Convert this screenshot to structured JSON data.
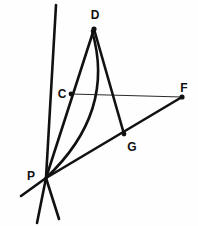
{
  "figure": {
    "background_color": "#fefefe",
    "ink_color": "#111111",
    "width": 198,
    "height": 226
  },
  "points": [
    {
      "id": "D",
      "label": "D",
      "x": 94,
      "y": 29,
      "label_x": 95,
      "label_y": 19,
      "dot": true
    },
    {
      "id": "C",
      "label": "C",
      "x": 71,
      "y": 94,
      "label_x": 62,
      "label_y": 94,
      "dot": true
    },
    {
      "id": "F",
      "label": "F",
      "x": 182,
      "y": 97,
      "label_x": 184,
      "label_y": 88,
      "dot": true
    },
    {
      "id": "G",
      "label": "G",
      "x": 124,
      "y": 134,
      "label_x": 132,
      "label_y": 147,
      "dot": true
    },
    {
      "id": "P",
      "label": "P",
      "x": 46,
      "y": 178,
      "label_x": 31,
      "label_y": 176,
      "dot": false
    }
  ],
  "segments": [
    {
      "id": "seg-C-F",
      "from": "C",
      "to": "F",
      "weight": "thin",
      "x1": 71,
      "y1": 94,
      "x2": 182,
      "y2": 97
    },
    {
      "id": "seg-D-C-P",
      "from": "D",
      "to": "P",
      "weight": "thick",
      "x1": 94,
      "y1": 29,
      "x2": 46,
      "y2": 178
    },
    {
      "id": "seg-D-G",
      "from": "D",
      "to": "G",
      "weight": "thick",
      "x1": 94,
      "y1": 29,
      "x2": 124,
      "y2": 134
    },
    {
      "id": "seg-P-G-F",
      "from": "P",
      "to": "F",
      "weight": "thick",
      "x1": 46,
      "y1": 178,
      "x2": 182,
      "y2": 97
    },
    {
      "id": "seg-topleft-P",
      "from": "top-left-ray",
      "to": "P",
      "weight": "thick",
      "x1": 56,
      "y1": 5,
      "x2": 46,
      "y2": 178
    },
    {
      "id": "seg-P-tail-left",
      "from": "P",
      "to": "lower-left-ray",
      "weight": "thick",
      "x1": 46,
      "y1": 178,
      "x2": 21,
      "y2": 196
    },
    {
      "id": "seg-P-tail-mid",
      "from": "P",
      "to": "lower-mid-ray",
      "weight": "thick",
      "x1": 46,
      "y1": 178,
      "x2": 37,
      "y2": 223
    },
    {
      "id": "seg-P-tail-right",
      "from": "P",
      "to": "lower-right-ray",
      "weight": "thick",
      "x1": 46,
      "y1": 178,
      "x2": 59,
      "y2": 219
    }
  ],
  "arcs": [
    {
      "id": "arc-D-P",
      "description": "curved arc bowing right from D down to P",
      "weight": "thick",
      "start_x": 92,
      "start_y": 31,
      "ctrl_x": 116,
      "ctrl_y": 112,
      "end_x": 46,
      "end_y": 178
    }
  ],
  "intersections": [
    {
      "id": "x-topleft-with-DP",
      "x": 85,
      "y": 58,
      "description": "top-left ray crosses segment D-P"
    },
    {
      "id": "x-CF-with-DG",
      "x": 114,
      "y": 95,
      "description": "segment C-F crosses segment D-G"
    },
    {
      "id": "x-CF-with-arc",
      "x": 96,
      "y": 95,
      "description": "segment C-F crosses arc D-P"
    }
  ]
}
